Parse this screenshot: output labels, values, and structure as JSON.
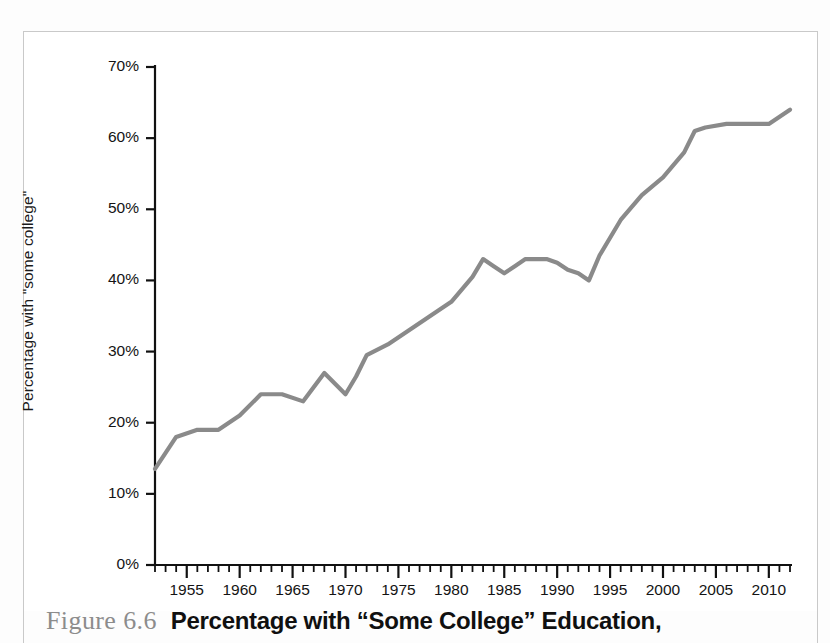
{
  "figure": {
    "number_label": "Figure 6.6",
    "caption_title": "Percentage with “Some College” Education,"
  },
  "chart_data": {
    "type": "line",
    "title": "",
    "xlabel": "",
    "ylabel": "Percentage with \"some college\"",
    "xlim": [
      1952,
      2012
    ],
    "ylim": [
      0,
      70
    ],
    "grid": false,
    "legend": null,
    "line_color": "#8a8a8a",
    "axis_color": "#111111",
    "x_major_ticks": [
      1955,
      1960,
      1965,
      1970,
      1975,
      1980,
      1985,
      1990,
      1995,
      2000,
      2005,
      2010
    ],
    "x_major_tick_labels": [
      "1955",
      "1960",
      "1965",
      "1970",
      "1975",
      "1980",
      "1985",
      "1990",
      "1995",
      "2000",
      "2005",
      "2010"
    ],
    "x_minor_tick_step": 1,
    "y_ticks": [
      0,
      10,
      20,
      30,
      40,
      50,
      60,
      70
    ],
    "y_tick_labels": [
      "0%",
      "10%",
      "20%",
      "30%",
      "40%",
      "50%",
      "60%",
      "70%"
    ],
    "series": [
      {
        "name": "Percentage with \"some college\"",
        "x": [
          1952,
          1954,
          1956,
          1958,
          1960,
          1962,
          1964,
          1966,
          1968,
          1970,
          1971,
          1972,
          1974,
          1976,
          1978,
          1980,
          1982,
          1983,
          1984,
          1985,
          1986,
          1987,
          1988,
          1989,
          1990,
          1991,
          1992,
          1993,
          1994,
          1996,
          1998,
          2000,
          2002,
          2003,
          2004,
          2006,
          2008,
          2010,
          2012
        ],
        "values": [
          13.5,
          18.0,
          19.0,
          19.0,
          21.0,
          24.0,
          24.0,
          23.0,
          27.0,
          24.0,
          26.5,
          29.5,
          31.0,
          33.0,
          35.0,
          37.0,
          40.5,
          43.0,
          42.0,
          41.0,
          42.0,
          43.0,
          43.0,
          43.0,
          42.5,
          41.5,
          41.0,
          40.0,
          43.5,
          48.5,
          52.0,
          54.5,
          58.0,
          61.0,
          61.5,
          62.0,
          62.0,
          62.0,
          64.0
        ]
      }
    ]
  }
}
